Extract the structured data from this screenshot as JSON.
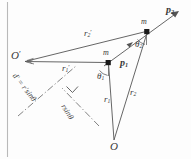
{
  "figure": {
    "background_color": "#fdfdfd",
    "stroke_color": "#555555",
    "label_color": "#3a3a3a",
    "width": 191,
    "height": 159
  },
  "points": [
    {
      "id": "O",
      "label": "O",
      "x": 114,
      "y": 140,
      "kind": "origin"
    },
    {
      "id": "Oprime",
      "label": "O",
      "prime": "′",
      "x": 24,
      "y": 61,
      "kind": "origin"
    },
    {
      "id": "m1",
      "label": "m",
      "x": 108,
      "y": 62,
      "kind": "particle"
    },
    {
      "id": "m2",
      "label": "m",
      "x": 148,
      "y": 31,
      "kind": "particle"
    }
  ],
  "vectors": [
    {
      "id": "r1",
      "label": "r",
      "sub": "1",
      "from": "O",
      "to": "m1",
      "style": "solid",
      "arrow": false
    },
    {
      "id": "r2",
      "label": "r",
      "sub": "2",
      "from": "O",
      "to": "m2",
      "style": "solid",
      "arrow": false
    },
    {
      "id": "r1prime",
      "label": "r",
      "sub": "1",
      "prime": "′",
      "from": "Oprime",
      "to": "m1",
      "style": "solid",
      "arrow": false
    },
    {
      "id": "r2prime",
      "label": "r",
      "sub": "2",
      "prime": "′",
      "from": "Oprime",
      "to": "m2",
      "style": "solid",
      "arrow": false
    },
    {
      "id": "p1",
      "label": "p",
      "sub": "1",
      "from": "m1",
      "to": "m2",
      "style": "solid",
      "arrow": true,
      "bold": true
    },
    {
      "id": "p2",
      "label": "p",
      "sub": "2",
      "from": "m2",
      "to": "beyond",
      "style": "solid",
      "arrow": true,
      "bold": true
    }
  ],
  "angles": [
    {
      "id": "theta1",
      "label": "θ",
      "sub": "1",
      "at": "m1",
      "between": [
        "r1",
        "p1"
      ]
    },
    {
      "id": "theta2",
      "label": "θ",
      "sub": "2",
      "at": "m2",
      "between": [
        "r2",
        "p2"
      ]
    }
  ],
  "distances": [
    {
      "id": "d-prime",
      "text": "d′ = r′sinθ",
      "style": "dash-dot",
      "rotation_deg": 52
    },
    {
      "id": "d-perp",
      "text": "rsinθ",
      "style": "dash-dot",
      "rotation_deg": 58
    }
  ],
  "markers": {
    "right_angle": {
      "id": "right-angle-marker",
      "x": 72,
      "y": 92
    }
  },
  "text_labels": {
    "O": "O",
    "O_prime_base": "O",
    "prime_glyph": "′",
    "m_upper": "m",
    "m_lower": "m",
    "p1": "p",
    "p1_sub": "1",
    "p2": "p",
    "p2_sub": "2",
    "r1": "r",
    "r1_sub": "1",
    "r2": "r",
    "r2_sub": "2",
    "r1_prime": "r",
    "r1_prime_sub": "1",
    "r2_prime": "r",
    "r2_prime_sub": "2",
    "theta1": "θ",
    "theta1_sub": "1",
    "theta2": "θ",
    "theta2_sub": "2",
    "d_prime_expr": "d′ = r′sinθ",
    "rsin_expr": "rsinθ"
  }
}
